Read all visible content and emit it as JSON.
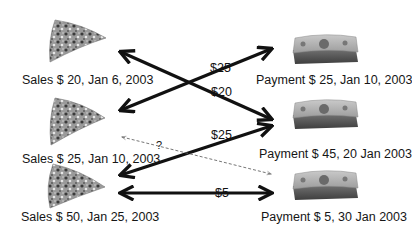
{
  "diagram": {
    "type": "many-to-many payment matching",
    "sales": [
      {
        "id": "sale-1",
        "label": "Sales $ 20, Jan 6, 2003",
        "icon": "pizza-slice-icon"
      },
      {
        "id": "sale-2",
        "label": "Sales $ 25, Jan 10, 2003",
        "icon": "pizza-slice-icon"
      },
      {
        "id": "sale-3",
        "label": "Sales $ 50, Jan 25, 2003",
        "icon": "pizza-slice-icon"
      }
    ],
    "payments": [
      {
        "id": "payment-1",
        "label": "Payment $ 25, Jan 10, 2003",
        "icon": "cash-stack-icon"
      },
      {
        "id": "payment-2",
        "label": "Payment $ 45, 20 Jan 2003",
        "icon": "cash-stack-icon"
      },
      {
        "id": "payment-3",
        "label": "Payment $ 5, 30 Jan 2003",
        "icon": "cash-stack-icon"
      }
    ],
    "links": [
      {
        "from": "sale-1",
        "to": "payment-2",
        "amount": "$20",
        "style": "solid",
        "direction": "both"
      },
      {
        "from": "sale-2",
        "to": "payment-1",
        "amount": "$25",
        "style": "solid",
        "direction": "both"
      },
      {
        "from": "sale-3",
        "to": "payment-2",
        "amount": "$25",
        "style": "solid",
        "direction": "both"
      },
      {
        "from": "sale-3",
        "to": "payment-3",
        "amount": "$5",
        "style": "solid",
        "direction": "both"
      },
      {
        "from": "sale-2",
        "to": "payment-3",
        "amount": "?",
        "style": "dashed",
        "direction": "both"
      }
    ],
    "colors": {
      "arrow": "#111111",
      "dashed_arrow": "#666666",
      "background": "#ffffff"
    }
  }
}
